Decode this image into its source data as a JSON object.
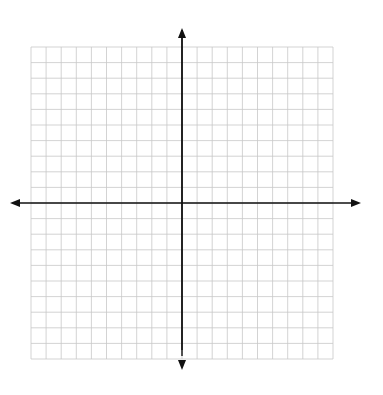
{
  "chart_data": {
    "type": "scatter",
    "title": "",
    "xlabel": "x",
    "ylabel": "y",
    "xlim": [
      -10,
      10
    ],
    "ylim": [
      -10,
      10
    ],
    "grid": true,
    "x_ticks": [
      "−10",
      "−9",
      "−8",
      "−7",
      "−6",
      "−5",
      "−4",
      "−3",
      "−2",
      "−1",
      "0",
      "1",
      "2",
      "3",
      "4",
      "5",
      "6",
      "7",
      "8",
      "9",
      "10"
    ],
    "y_ticks": [
      "10",
      "9",
      "8",
      "7",
      "6",
      "5",
      "4",
      "3",
      "2",
      "1",
      "0",
      "−1",
      "−2",
      "−3",
      "−4",
      "−5",
      "−6",
      "−7",
      "−8",
      "−9",
      "−10"
    ],
    "series": [
      {
        "name": "Triangle ABC",
        "points": [
          {
            "label": "A",
            "x": -3,
            "y": 6
          },
          {
            "label": "B",
            "x": -3,
            "y": 3
          },
          {
            "label": "C",
            "x": -5,
            "y": 3
          }
        ]
      },
      {
        "name": "Triangle A'B'C'",
        "points": [
          {
            "label": "A'",
            "x": 2,
            "y": -1
          },
          {
            "label": "B'",
            "x": 2,
            "y": -4
          },
          {
            "label": "C'",
            "x": 0,
            "y": -4
          }
        ]
      }
    ]
  }
}
